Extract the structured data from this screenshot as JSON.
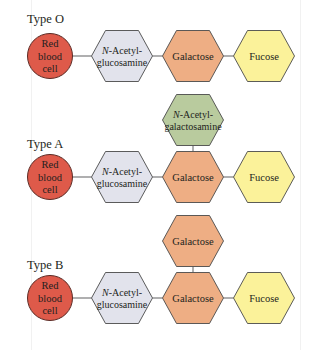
{
  "colors": {
    "red_blood_cell": "#de5a4a",
    "n_acetylglucosamine": "#e2e3ec",
    "n_acetylgalactosamine": "#b9cb9e",
    "galactose": "#eeae84",
    "fucose": "#fbf29a",
    "connector": "#6d6e70"
  },
  "diagram": {
    "types": [
      {
        "label": "Type O",
        "cell": {
          "lines": [
            "Red",
            "blood",
            "cell"
          ]
        },
        "chain": [
          {
            "name": "N-Acetylglucosamine",
            "lines": [
              [
                "N",
                "-Acetyl-"
              ],
              [
                "glucosamine"
              ]
            ],
            "color_key": "n_acetylglucosamine"
          },
          {
            "name": "Galactose",
            "lines": [
              [
                "Galactose"
              ]
            ],
            "color_key": "galactose"
          },
          {
            "name": "Fucose",
            "lines": [
              [
                "Fucose"
              ]
            ],
            "color_key": "fucose"
          }
        ],
        "branch": null
      },
      {
        "label": "Type A",
        "cell": {
          "lines": [
            "Red",
            "blood",
            "cell"
          ]
        },
        "chain": [
          {
            "name": "N-Acetylglucosamine",
            "lines": [
              [
                "N",
                "-Acetyl-"
              ],
              [
                "glucosamine"
              ]
            ],
            "color_key": "n_acetylglucosamine"
          },
          {
            "name": "Galactose",
            "lines": [
              [
                "Galactose"
              ]
            ],
            "color_key": "galactose"
          },
          {
            "name": "Fucose",
            "lines": [
              [
                "Fucose"
              ]
            ],
            "color_key": "fucose"
          }
        ],
        "branch": {
          "name": "N-Acetylgalactosamine",
          "lines": [
            [
              "N",
              "-Acetyl-"
            ],
            [
              "galactosamine"
            ]
          ],
          "color_key": "n_acetylgalactosamine"
        }
      },
      {
        "label": "Type B",
        "cell": {
          "lines": [
            "Red",
            "blood",
            "cell"
          ]
        },
        "chain": [
          {
            "name": "N-Acetylglucosamine",
            "lines": [
              [
                "N",
                "-Acetyl-"
              ],
              [
                "glucosamine"
              ]
            ],
            "color_key": "n_acetylglucosamine"
          },
          {
            "name": "Galactose",
            "lines": [
              [
                "Galactose"
              ]
            ],
            "color_key": "galactose"
          },
          {
            "name": "Fucose",
            "lines": [
              [
                "Fucose"
              ]
            ],
            "color_key": "fucose"
          }
        ],
        "branch": {
          "name": "Galactose",
          "lines": [
            [
              "Galactose"
            ]
          ],
          "color_key": "galactose"
        }
      }
    ]
  }
}
